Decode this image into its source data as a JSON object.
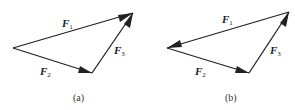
{
  "figures": [
    {
      "caption": "(a)",
      "vectors": [
        {
          "name": "F",
          "sub": "1",
          "from": "left",
          "to": "top"
        },
        {
          "name": "F",
          "sub": "2",
          "from": "left",
          "to": "bottom"
        },
        {
          "name": "F",
          "sub": "3",
          "from": "bottom",
          "to": "top"
        }
      ]
    },
    {
      "caption": "(b)",
      "vectors": [
        {
          "name": "F",
          "sub": "1",
          "from": "top",
          "to": "left"
        },
        {
          "name": "F",
          "sub": "2",
          "from": "left",
          "to": "bottom"
        },
        {
          "name": "F",
          "sub": "3",
          "from": "bottom",
          "to": "top"
        }
      ]
    }
  ]
}
